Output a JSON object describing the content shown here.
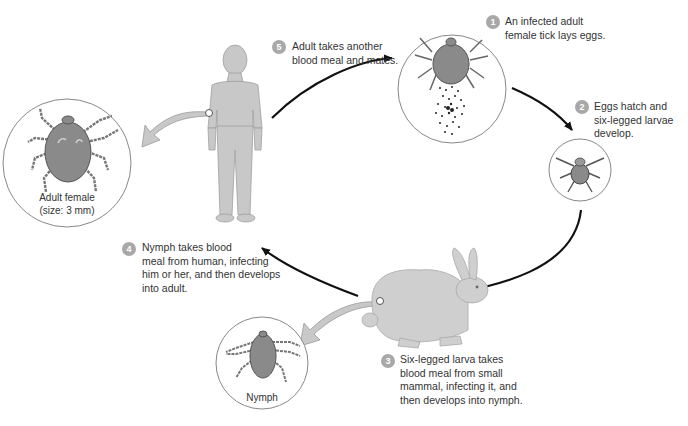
{
  "diagram": {
    "accent_badge_color": "#a8a8a8",
    "arrow_color": "#111111",
    "organism_fill": "#c8c8c8",
    "tick_fill": "#8a8a8a"
  },
  "steps": [
    {
      "number": "1",
      "lines": [
        "An infected adult",
        "female tick lays eggs."
      ]
    },
    {
      "number": "2",
      "lines": [
        "Eggs hatch and",
        "six-legged larvae",
        "develop."
      ]
    },
    {
      "number": "3",
      "lines": [
        "Six-legged larva takes",
        "blood meal from small",
        "mammal, infecting it, and",
        "then develops into nymph."
      ]
    },
    {
      "number": "4",
      "lines": [
        "Nymph takes blood",
        "meal from human, infecting",
        "him or her, and then develops",
        "into adult."
      ]
    },
    {
      "number": "5",
      "lines": [
        "Adult takes another",
        "blood meal and mates."
      ]
    }
  ],
  "insets": {
    "adult_female": {
      "lines": [
        "Adult female",
        "(size: 3 mm)"
      ]
    },
    "nymph": {
      "lines": [
        "Nymph"
      ]
    }
  },
  "figures": {
    "human": "human-figure",
    "rabbit": "rabbit-figure",
    "egg_laying_tick": "tick-laying-eggs",
    "larva": "six-legged-larva"
  }
}
